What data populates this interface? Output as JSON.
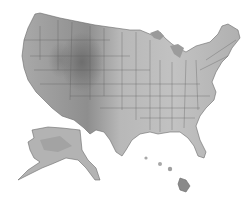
{
  "map": {
    "title": "",
    "style": "grayscale shaded relief",
    "regions": [
      "Contiguous United States",
      "Alaska",
      "Hawaii"
    ],
    "colors": {
      "background": "#ffffff",
      "lowland": "#c8c8c8",
      "midland": "#a8a8a8",
      "highland": "#787878",
      "water_lakes": "#9a9a9a",
      "borders": "#5a5a5a"
    }
  }
}
